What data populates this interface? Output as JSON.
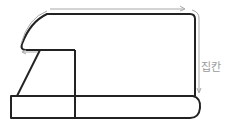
{
  "diagram": {
    "label": "집칸",
    "colors": {
      "outline": "#222222",
      "dimension": "#a8a8a8",
      "label": "#9a9a9a",
      "background": "#ffffff"
    }
  }
}
